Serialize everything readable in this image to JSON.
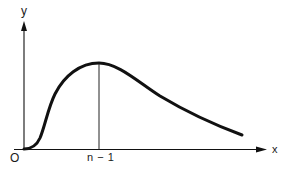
{
  "diagram": {
    "axes": {
      "x_label": "x",
      "y_label": "y",
      "origin_label": "O"
    },
    "annotations": {
      "peak_label": "n − 1"
    },
    "colors": {
      "stroke": "#111111",
      "background": "#ffffff"
    }
  }
}
